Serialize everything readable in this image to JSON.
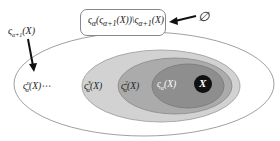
{
  "diagram": {
    "top_box": {
      "label_parts": [
        "ς",
        "α",
        "(ς",
        "α+1",
        "(X))\\ς",
        "α+1",
        "(X)"
      ],
      "text": "ςα(ςα+1(X))\\ςα+1(X)"
    },
    "empty_set": {
      "symbol": "∅"
    },
    "left_label": {
      "base": "ς",
      "sub": "α+1",
      "arg": "(X)"
    },
    "outer_label": {
      "base": "ς",
      "sub": "α",
      "sup": "n",
      "arg": "(X)⋯"
    },
    "ring2_label": {
      "base": "ς",
      "sub": "α",
      "sup": "3",
      "arg": "(X)"
    },
    "ring1_label": {
      "base": "ς",
      "sub": "α",
      "sup": "2",
      "arg": "(X)"
    },
    "ring0_label": {
      "base": "ς",
      "sub": "α",
      "arg": "(X)"
    },
    "core_label": {
      "text": "X"
    },
    "colors": {
      "outer_fill": "#ffffff",
      "ring3_fill": "#cfcfcf",
      "ring2_fill": "#a9a9a9",
      "ring1_fill": "#8c8c8c",
      "core_fill": "#111111",
      "stroke": "#777777"
    }
  }
}
